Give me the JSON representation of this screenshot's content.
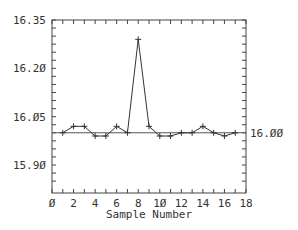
{
  "chart_data": {
    "type": "line",
    "title": "",
    "xlabel": "Sample Number",
    "ylabel": "",
    "xlim": [
      0,
      18
    ],
    "ylim": [
      15.85,
      16.35
    ],
    "x_ticks": [
      "Ø",
      "2",
      "4",
      "6",
      "8",
      "1Ø",
      "12",
      "14",
      "16",
      "18"
    ],
    "y_ticks": [
      "16.35",
      "16.2Ø",
      "16.Ø5",
      "15.9Ø"
    ],
    "y_tick_values": [
      16.35,
      16.2,
      16.05,
      15.9
    ],
    "center_line": {
      "value": 16.0,
      "label": "16.ØØ"
    },
    "grid": false,
    "marker": "+",
    "x": [
      1,
      2,
      3,
      4,
      5,
      6,
      7,
      8,
      9,
      10,
      11,
      12,
      13,
      14,
      15,
      16,
      17
    ],
    "series": [
      {
        "name": "sample",
        "values": [
          16.0,
          16.02,
          16.02,
          15.99,
          15.99,
          16.02,
          16.0,
          16.29,
          16.02,
          15.99,
          15.99,
          16.0,
          16.0,
          16.02,
          16.0,
          15.99,
          16.0
        ]
      }
    ],
    "colors": {
      "line": "#333333",
      "axis": "#444444",
      "center_line": "#555555"
    }
  }
}
